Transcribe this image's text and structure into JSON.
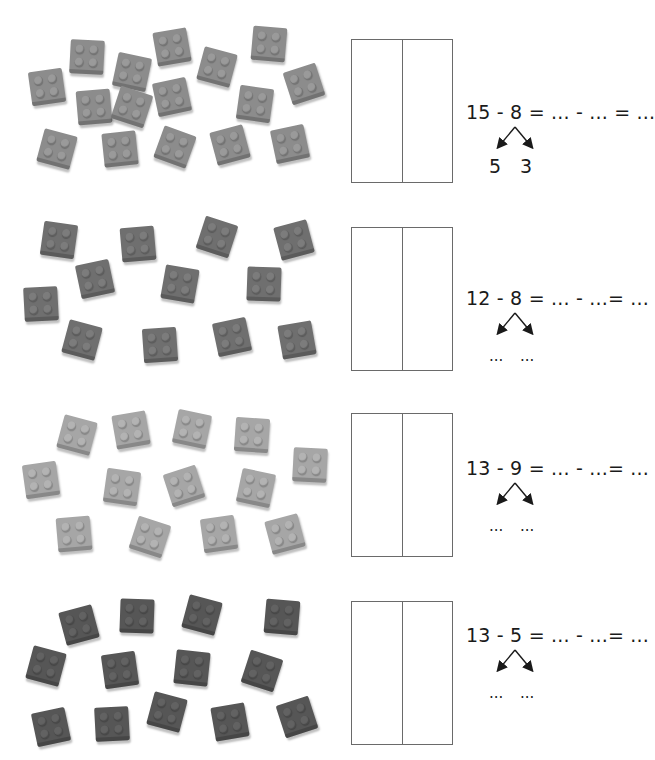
{
  "worksheet": {
    "exercises": [
      {
        "id": 1,
        "brick_count": 15,
        "brick_color": "#8c8c8c",
        "stud_color": "#9a9a9a",
        "top": 15,
        "equation": "15 - 8 = ... - ... = ...",
        "split_left": "5",
        "split_right": "3",
        "bricks": [
          [
            15,
            55,
            -8
          ],
          [
            55,
            25,
            3
          ],
          [
            100,
            40,
            12
          ],
          [
            140,
            15,
            -10
          ],
          [
            185,
            35,
            15
          ],
          [
            237,
            12,
            5
          ],
          [
            272,
            52,
            -18
          ],
          [
            62,
            75,
            -5
          ],
          [
            100,
            75,
            18
          ],
          [
            140,
            65,
            -12
          ],
          [
            223,
            72,
            8
          ],
          [
            25,
            117,
            15
          ],
          [
            88,
            117,
            -6
          ],
          [
            143,
            115,
            20
          ],
          [
            198,
            113,
            -15
          ],
          [
            258,
            112,
            -12
          ]
        ]
      },
      {
        "id": 2,
        "brick_count": 12,
        "brick_color": "#6f6f6f",
        "stud_color": "#7c7c7c",
        "top": 205,
        "equation": "12 - 8 = ... - ...= ...",
        "split_left": "...",
        "split_right": "...",
        "bricks": [
          [
            27,
            18,
            8
          ],
          [
            106,
            22,
            -5
          ],
          [
            185,
            15,
            18
          ],
          [
            262,
            18,
            -15
          ],
          [
            63,
            57,
            -12
          ],
          [
            148,
            62,
            10
          ],
          [
            232,
            62,
            2
          ],
          [
            9,
            82,
            -3
          ],
          [
            50,
            118,
            15
          ],
          [
            128,
            123,
            -4
          ],
          [
            200,
            115,
            -12
          ],
          [
            265,
            118,
            -10
          ]
        ]
      },
      {
        "id": 3,
        "brick_count": 13,
        "brick_color": "#a6a6a6",
        "stud_color": "#b3b3b3",
        "top": 400,
        "equation": "13 - 9 = ... - ...= ...",
        "split_left": "...",
        "split_right": "...",
        "bricks": [
          [
            45,
            18,
            15
          ],
          [
            99,
            13,
            -10
          ],
          [
            160,
            12,
            12
          ],
          [
            220,
            18,
            4
          ],
          [
            278,
            48,
            3
          ],
          [
            9,
            63,
            -8
          ],
          [
            90,
            70,
            8
          ],
          [
            152,
            69,
            -18
          ],
          [
            224,
            71,
            12
          ],
          [
            42,
            117,
            -5
          ],
          [
            118,
            120,
            18
          ],
          [
            187,
            117,
            -8
          ],
          [
            253,
            117,
            -15
          ]
        ]
      },
      {
        "id": 4,
        "brick_count": 13,
        "brick_color": "#565656",
        "stud_color": "#626262",
        "top": 585,
        "equation": "13 - 5 = ... - ...= ...",
        "split_left": "...",
        "split_right": "...",
        "bricks": [
          [
            47,
            23,
            -15
          ],
          [
            105,
            14,
            2
          ],
          [
            170,
            13,
            15
          ],
          [
            250,
            15,
            5
          ],
          [
            14,
            64,
            15
          ],
          [
            88,
            68,
            -8
          ],
          [
            160,
            66,
            6
          ],
          [
            230,
            69,
            18
          ],
          [
            19,
            125,
            -12
          ],
          [
            80,
            122,
            -3
          ],
          [
            135,
            110,
            15
          ],
          [
            198,
            120,
            -10
          ],
          [
            265,
            115,
            -18
          ]
        ]
      }
    ],
    "box_tops": [
      39,
      227,
      413,
      601
    ],
    "equation_tops": [
      101,
      287,
      457,
      624
    ],
    "colors": {
      "text": "#1a1a1a",
      "box_border": "#6a6a6a",
      "background": "#ffffff"
    }
  }
}
